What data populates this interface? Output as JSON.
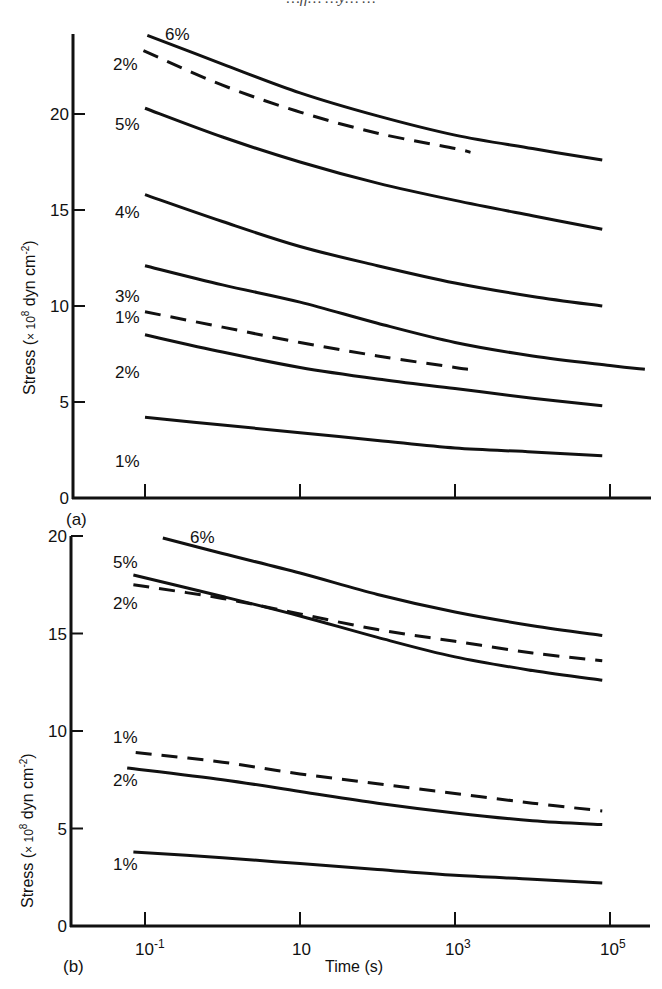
{
  "header": {
    "partial_text": "…ff… …y… …"
  },
  "chart_data": [
    {
      "panel": "(a)",
      "type": "line",
      "xscale": "log",
      "xlabel": "",
      "ylabel": "Stress (× 10⁸ dyn cm⁻²)",
      "ylim": [
        0,
        24
      ],
      "yticks": [
        0,
        5,
        10,
        15,
        20
      ],
      "xticks": [
        {
          "value": 0.1,
          "label": ""
        },
        {
          "value": 10,
          "label": ""
        },
        {
          "value": 1000,
          "label": ""
        },
        {
          "value": 100000,
          "label": ""
        }
      ],
      "xlim_log10": [
        -1.0,
        5.6
      ],
      "series": [
        {
          "name": "6%",
          "style": "solid",
          "log10_t": [
            -0.97,
            0,
            1,
            2,
            3,
            4,
            4.9
          ],
          "values": [
            24.1,
            22.6,
            21.1,
            19.9,
            18.9,
            18.2,
            17.6
          ]
        },
        {
          "name": "2%",
          "style": "dashed",
          "log10_t": [
            -1.02,
            0,
            1,
            2,
            3,
            3.2
          ],
          "values": [
            23.3,
            21.5,
            20.1,
            19.0,
            18.2,
            18.0
          ]
        },
        {
          "name": "5%",
          "style": "solid",
          "log10_t": [
            -1.0,
            0,
            1,
            2,
            3,
            4,
            4.9
          ],
          "values": [
            20.3,
            18.8,
            17.5,
            16.4,
            15.5,
            14.7,
            14.0
          ]
        },
        {
          "name": "4%",
          "style": "solid",
          "log10_t": [
            -1.0,
            0,
            1,
            2,
            3,
            4,
            4.9
          ],
          "values": [
            15.8,
            14.4,
            13.1,
            12.1,
            11.2,
            10.5,
            10.0
          ]
        },
        {
          "name": "3%",
          "style": "solid",
          "log10_t": [
            -1.0,
            0,
            1,
            2,
            3,
            4,
            5,
            5.45
          ],
          "values": [
            12.1,
            11.1,
            10.2,
            9.1,
            8.1,
            7.4,
            6.9,
            6.7
          ]
        },
        {
          "name": "1%",
          "style": "dashed",
          "log10_t": [
            -1.0,
            0,
            1,
            2,
            3,
            3.2
          ],
          "values": [
            9.7,
            8.9,
            8.1,
            7.4,
            6.8,
            6.7
          ]
        },
        {
          "name": "2%",
          "style": "solid",
          "log10_t": [
            -1.0,
            0,
            1,
            2,
            3,
            4,
            4.9
          ],
          "values": [
            8.5,
            7.6,
            6.8,
            6.2,
            5.7,
            5.2,
            4.8
          ]
        },
        {
          "name": "1%",
          "style": "solid",
          "log10_t": [
            -1.0,
            0,
            1,
            2,
            3,
            4,
            4.9
          ],
          "values": [
            4.2,
            3.8,
            3.4,
            3.0,
            2.6,
            2.4,
            2.2
          ]
        }
      ]
    },
    {
      "panel": "(b)",
      "type": "line",
      "xscale": "log",
      "xlabel": "Time (s)",
      "ylabel": "Stress (× 10⁸ dyn cm⁻²)",
      "ylim": [
        0,
        20
      ],
      "yticks": [
        0,
        5,
        10,
        15,
        20
      ],
      "xticks": [
        {
          "value": 0.1,
          "label": "10-1"
        },
        {
          "value": 10,
          "label": "10"
        },
        {
          "value": 1000,
          "label": "103"
        },
        {
          "value": 100000,
          "label": "105"
        }
      ],
      "xlim_log10": [
        -1.0,
        5.6
      ],
      "series": [
        {
          "name": "6%",
          "style": "solid",
          "log10_t": [
            -0.77,
            0,
            1,
            2,
            3,
            4,
            4.9
          ],
          "values": [
            19.9,
            19.1,
            18.1,
            17.0,
            16.1,
            15.4,
            14.9
          ]
        },
        {
          "name": "5%",
          "style": "solid",
          "log10_t": [
            -1.15,
            0,
            1,
            2,
            3,
            4,
            4.9
          ],
          "values": [
            18.0,
            16.9,
            15.9,
            14.8,
            13.8,
            13.1,
            12.6
          ]
        },
        {
          "name": "2%",
          "style": "dashed",
          "log10_t": [
            -1.15,
            0,
            1,
            2,
            3,
            4,
            4.9
          ],
          "values": [
            17.5,
            16.8,
            16.0,
            15.2,
            14.6,
            14.0,
            13.6
          ]
        },
        {
          "name": "1%",
          "style": "dashed",
          "log10_t": [
            -1.12,
            0,
            1,
            2,
            3,
            4,
            4.9
          ],
          "values": [
            8.9,
            8.4,
            7.8,
            7.3,
            6.8,
            6.3,
            5.9
          ]
        },
        {
          "name": "2%",
          "style": "solid",
          "log10_t": [
            -1.23,
            0,
            1,
            2,
            3,
            4,
            4.9
          ],
          "values": [
            8.1,
            7.5,
            6.9,
            6.3,
            5.8,
            5.4,
            5.2
          ]
        },
        {
          "name": "1%",
          "style": "solid",
          "log10_t": [
            -1.15,
            0,
            1,
            2,
            3,
            4,
            4.9
          ],
          "values": [
            3.8,
            3.5,
            3.2,
            2.9,
            2.6,
            2.4,
            2.2
          ]
        }
      ]
    }
  ],
  "labels": {
    "panel_a": "(a)",
    "panel_b": "(b)",
    "ylabel_prefix": "Stress (",
    "ylabel_times": "× 10",
    "ylabel_exp": "8",
    "ylabel_unit": " dyn cm",
    "ylabel_unit_exp": "-2",
    "ylabel_suffix": ")",
    "xlabel": "Time (s)",
    "xtick_base": "10",
    "xtick_exps": [
      "-1",
      "",
      "3",
      "5"
    ]
  },
  "curve_labels_a": [
    {
      "text": "6%",
      "x": 165,
      "y": 40
    },
    {
      "text": "2%",
      "x": 113,
      "y": 70
    },
    {
      "text": "5%",
      "x": 115,
      "y": 130
    },
    {
      "text": "4%",
      "x": 115,
      "y": 218
    },
    {
      "text": "3%",
      "x": 115,
      "y": 302
    },
    {
      "text": "1%",
      "x": 115,
      "y": 323
    },
    {
      "text": "2%",
      "x": 115,
      "y": 378
    },
    {
      "text": "1%",
      "x": 115,
      "y": 467
    }
  ],
  "curve_labels_b": [
    {
      "text": "6%",
      "x": 190,
      "y": 543
    },
    {
      "text": "5%",
      "x": 113,
      "y": 568
    },
    {
      "text": "2%",
      "x": 113,
      "y": 609
    },
    {
      "text": "1%",
      "x": 113,
      "y": 743
    },
    {
      "text": "2%",
      "x": 113,
      "y": 786
    },
    {
      "text": "1%",
      "x": 113,
      "y": 870
    }
  ]
}
